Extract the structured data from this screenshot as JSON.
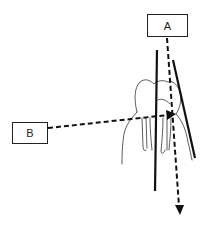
{
  "diagram": {
    "labels": {
      "a": "A",
      "b": "B"
    },
    "elements": [
      {
        "id": "box-a",
        "type": "label-box",
        "text": "A"
      },
      {
        "id": "box-b",
        "type": "label-box",
        "text": "B"
      },
      {
        "id": "tooth",
        "type": "illustration",
        "description": "molar tooth with roots"
      },
      {
        "id": "line-vertical",
        "type": "solid-line"
      },
      {
        "id": "line-slanted",
        "type": "solid-line"
      },
      {
        "id": "arrow-a",
        "type": "dashed-arrow",
        "from": "A",
        "direction": "down"
      },
      {
        "id": "arrow-b",
        "type": "dashed-arrow",
        "from": "B",
        "direction": "right"
      }
    ],
    "colors": {
      "stroke": "#111111",
      "background": "#ffffff"
    }
  }
}
